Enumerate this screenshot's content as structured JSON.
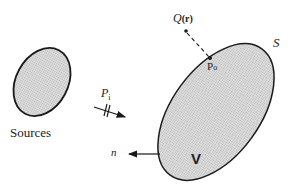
{
  "diagram": {
    "colors": {
      "stroke": "#1a1a1a",
      "fill": "#cfcfcf",
      "background": "#ffffff"
    },
    "labels": {
      "sources": "Sources",
      "incident": "P",
      "incident_sub": "i",
      "observer": "Q",
      "observer_arg": "(r)",
      "surface_point": "P",
      "surface_point_sub": "o",
      "surface": "S",
      "normal": "n",
      "volume": "V"
    }
  }
}
